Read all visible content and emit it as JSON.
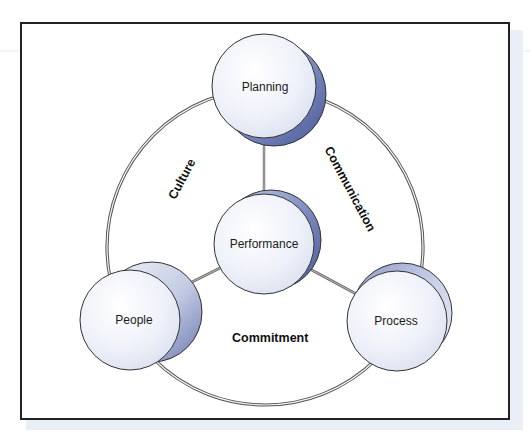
{
  "diagram": {
    "center_node": {
      "label": "Performance"
    },
    "nodes": [
      {
        "id": "planning",
        "label": "Planning"
      },
      {
        "id": "people",
        "label": "People"
      },
      {
        "id": "process",
        "label": "Process"
      }
    ],
    "ring_labels": [
      {
        "id": "culture",
        "label": "Culture"
      },
      {
        "id": "communication",
        "label": "Communication"
      },
      {
        "id": "commitment",
        "label": "Commitment"
      }
    ],
    "colors": {
      "frame_border": "#222222",
      "circle_fill_light": "#ffffff",
      "circle_fill_dark": "#dfe4f2",
      "shadow_dark": "#4a5a98",
      "shadow_light": "#9aa6cf",
      "ring_stroke": "#555555",
      "connector": "#666666"
    }
  }
}
